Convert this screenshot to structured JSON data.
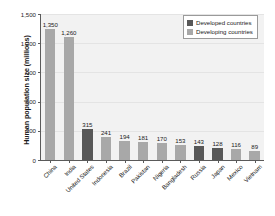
{
  "chart_data": {
    "type": "bar",
    "title": "",
    "xlabel": "",
    "ylabel": "Human population size (millions)",
    "ylim": [
      0,
      1500
    ],
    "yticks": [
      "0",
      "300",
      "600",
      "900",
      "1,200",
      "1,500"
    ],
    "ytick_values": [
      0,
      300,
      600,
      900,
      1200,
      1500
    ],
    "grid": true,
    "legend_position": "top-right",
    "categories": [
      "China",
      "India",
      "United States",
      "Indonesia",
      "Brazil",
      "Pakistan",
      "Nigeria",
      "Bangladesh",
      "Russia",
      "Japan",
      "Mexico",
      "Vietnam"
    ],
    "values": [
      1350,
      1260,
      315,
      241,
      194,
      181,
      170,
      153,
      143,
      128,
      116,
      89
    ],
    "value_labels": [
      "1,350",
      "1,260",
      "315",
      "241",
      "194",
      "181",
      "170",
      "153",
      "143",
      "128",
      "116",
      "89"
    ],
    "groups": [
      "developing",
      "developing",
      "developed",
      "developing",
      "developing",
      "developing",
      "developing",
      "developing",
      "developed",
      "developed",
      "developing",
      "developing"
    ],
    "series": [
      {
        "name": "Developed countries",
        "color": "#585858",
        "points": [
          {
            "category": "United States",
            "value": 315
          },
          {
            "category": "Russia",
            "value": 143
          },
          {
            "category": "Japan",
            "value": 128
          }
        ]
      },
      {
        "name": "Developing countries",
        "color": "#a8a8a8",
        "points": [
          {
            "category": "China",
            "value": 1350
          },
          {
            "category": "India",
            "value": 1260
          },
          {
            "category": "Indonesia",
            "value": 241
          },
          {
            "category": "Brazil",
            "value": 194
          },
          {
            "category": "Pakistan",
            "value": 181
          },
          {
            "category": "Nigeria",
            "value": 170
          },
          {
            "category": "Bangladesh",
            "value": 153
          },
          {
            "category": "Mexico",
            "value": 116
          },
          {
            "category": "Vietnam",
            "value": 89
          }
        ]
      }
    ]
  },
  "legend": {
    "items": [
      {
        "label": "Developed countries",
        "color": "#585858",
        "key": "developed"
      },
      {
        "label": "Developing countries",
        "color": "#a8a8a8",
        "key": "developing"
      }
    ]
  },
  "colors": {
    "developed": "#585858",
    "developing": "#a8a8a8",
    "plot_background": "#f2f2f2",
    "gridline": "#e4e4e4",
    "axis": "#5a5a5a",
    "text": "#1a1a1a"
  }
}
